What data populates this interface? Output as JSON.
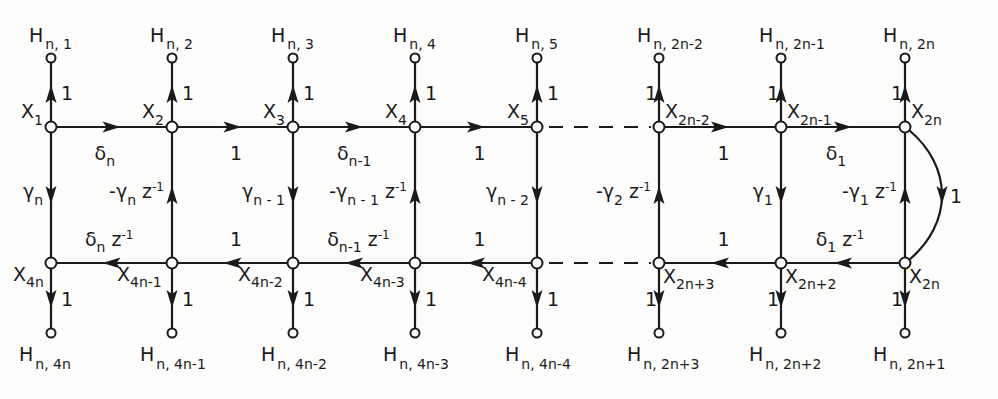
{
  "diagram": {
    "columns_x": [
      51,
      172,
      293,
      415,
      537,
      659,
      781,
      905
    ],
    "rows": {
      "top_terminal_y": 58,
      "top_y": 127,
      "bottom_y": 263,
      "bottom_terminal_y": 333
    },
    "top_outputs": [
      {
        "main": "H",
        "sub": "n, 1"
      },
      {
        "main": "H",
        "sub": "n, 2"
      },
      {
        "main": "H",
        "sub": "n, 3"
      },
      {
        "main": "H",
        "sub": "n, 4"
      },
      {
        "main": "H",
        "sub": "n, 5"
      },
      {
        "main": "H",
        "sub": "n, 2n-2"
      },
      {
        "main": "H",
        "sub": "n, 2n-1"
      },
      {
        "main": "H",
        "sub": "n, 2n"
      }
    ],
    "bottom_outputs": [
      {
        "main": "H",
        "sub": "n, 4n"
      },
      {
        "main": "H",
        "sub": "n, 4n-1"
      },
      {
        "main": "H",
        "sub": "n, 4n-2"
      },
      {
        "main": "H",
        "sub": "n, 4n-3"
      },
      {
        "main": "H",
        "sub": "n, 4n-4"
      },
      {
        "main": "H",
        "sub": "n, 2n+3"
      },
      {
        "main": "H",
        "sub": "n, 2n+2"
      },
      {
        "main": "H",
        "sub": "n, 2n+1"
      }
    ],
    "top_nodes": [
      {
        "main": "X",
        "sub": "1"
      },
      {
        "main": "X",
        "sub": "2"
      },
      {
        "main": "X",
        "sub": "3"
      },
      {
        "main": "X",
        "sub": "4"
      },
      {
        "main": "X",
        "sub": "5"
      },
      {
        "main": "X",
        "sub": "2n-2"
      },
      {
        "main": "X",
        "sub": "2n-1"
      },
      {
        "main": "X",
        "sub": "2n"
      }
    ],
    "bottom_nodes": [
      {
        "main": "X",
        "sub": "4n"
      },
      {
        "main": "X",
        "sub": "4n-1"
      },
      {
        "main": "X",
        "sub": "4n-2"
      },
      {
        "main": "X",
        "sub": "4n-3"
      },
      {
        "main": "X",
        "sub": "4n-4"
      },
      {
        "main": "X",
        "sub": "2n+3"
      },
      {
        "main": "X",
        "sub": "2n+2"
      },
      {
        "main": "X",
        "sub": "2n"
      }
    ],
    "output_gain": "1",
    "top_edges": [
      {
        "main": "δ",
        "sub": "n",
        "sup": ""
      },
      {
        "main": "1",
        "sub": "",
        "sup": ""
      },
      {
        "main": "δ",
        "sub": "n-1",
        "sup": ""
      },
      {
        "main": "1",
        "sub": "",
        "sup": ""
      },
      {
        "main": "",
        "sub": "",
        "sup": "",
        "dashed": true
      },
      {
        "main": "1",
        "sub": "",
        "sup": ""
      },
      {
        "main": "δ",
        "sub": "1",
        "sup": ""
      }
    ],
    "bottom_edges": [
      {
        "main": "δ",
        "sub": "n",
        "sup": "z",
        "exp": "-1"
      },
      {
        "main": "1",
        "sub": "",
        "sup": ""
      },
      {
        "main": "δ",
        "sub": "n-1",
        "sup": "z",
        "exp": "-1"
      },
      {
        "main": "1",
        "sub": "",
        "sup": ""
      },
      {
        "main": "",
        "sub": "",
        "sup": "",
        "dashed": true
      },
      {
        "main": "1",
        "sub": "",
        "sup": ""
      },
      {
        "main": "δ",
        "sub": "1",
        "sup": "z",
        "exp": "-1"
      }
    ],
    "vertical_edges": [
      {
        "pre": "",
        "main": "γ",
        "sub": "n",
        "z": "",
        "exp": "",
        "direction": "down"
      },
      {
        "pre": "-",
        "main": "γ",
        "sub": "n",
        "z": "z",
        "exp": "-1",
        "direction": "up"
      },
      {
        "pre": "",
        "main": "γ",
        "sub": "n - 1",
        "z": "",
        "exp": "",
        "direction": "down"
      },
      {
        "pre": "-",
        "main": "γ",
        "sub": "n - 1",
        "z": "z",
        "exp": "-1",
        "direction": "up"
      },
      {
        "pre": "",
        "main": "γ",
        "sub": "n - 2",
        "z": "",
        "exp": "",
        "direction": "down"
      },
      {
        "pre": "-",
        "main": "γ",
        "sub": "2",
        "z": "z",
        "exp": "-1",
        "direction": "up"
      },
      {
        "pre": "",
        "main": "γ",
        "sub": "1",
        "z": "",
        "exp": "",
        "direction": "down"
      },
      {
        "pre": "-",
        "main": "γ",
        "sub": "1",
        "z": "z",
        "exp": "-1",
        "direction": "up"
      }
    ],
    "arc_edge": {
      "label": "1",
      "direction": "down"
    }
  }
}
